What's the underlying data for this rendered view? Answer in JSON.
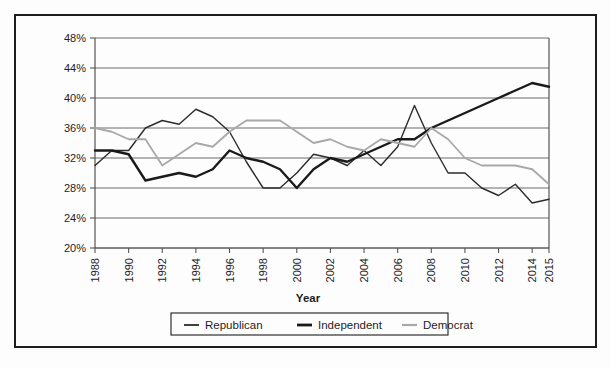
{
  "figure": {
    "top_caption": "",
    "frame_color": "#1d1d1d",
    "background": "#fdfdfd"
  },
  "chart_data": {
    "type": "line",
    "title": "",
    "xlabel": "Year",
    "ylabel": "",
    "grid": true,
    "legend_position": "bottom",
    "xlim": [
      1988,
      2015
    ],
    "ylim": [
      20,
      48
    ],
    "ytick_labels": [
      "20%",
      "24%",
      "28%",
      "32%",
      "36%",
      "40%",
      "44%",
      "48%"
    ],
    "ytick_values": [
      20,
      24,
      28,
      32,
      36,
      40,
      44,
      48
    ],
    "xtick_labels": [
      "1988",
      "1990",
      "1992",
      "1994",
      "1996",
      "1998",
      "2000",
      "2002",
      "2004",
      "2006",
      "2008",
      "2010",
      "2012",
      "2014",
      "2015"
    ],
    "xtick_values": [
      1988,
      1990,
      1992,
      1994,
      1996,
      1998,
      2000,
      2002,
      2004,
      2006,
      2008,
      2010,
      2012,
      2014,
      2015
    ],
    "x": [
      1988,
      1989,
      1990,
      1991,
      1992,
      1993,
      1994,
      1995,
      1996,
      1997,
      1998,
      1999,
      2000,
      2001,
      2002,
      2003,
      2004,
      2005,
      2006,
      2007,
      2008,
      2009,
      2010,
      2011,
      2012,
      2013,
      2014,
      2015
    ],
    "series": [
      {
        "name": "Republican",
        "color": "#2b2b2b",
        "width": 1.4,
        "values": [
          31.0,
          33.0,
          33.0,
          36.0,
          37.0,
          36.5,
          38.5,
          37.5,
          35.5,
          31.5,
          28.0,
          28.0,
          30.0,
          32.5,
          32.0,
          31.0,
          33.0,
          31.0,
          33.5,
          39.0,
          34.0,
          30.0,
          30.0,
          28.0,
          27.0,
          28.5,
          26.0,
          26.5
        ]
      },
      {
        "name": "Independent",
        "color": "#1a1a1a",
        "width": 2.4,
        "values": [
          33.0,
          33.0,
          32.5,
          29.0,
          29.5,
          30.0,
          29.5,
          30.5,
          33.0,
          32.0,
          31.5,
          30.5,
          28.0,
          30.5,
          32.0,
          31.5,
          32.5,
          33.5,
          34.5,
          34.5,
          36.0,
          37.0,
          38.0,
          39.0,
          40.0,
          41.0,
          42.0,
          41.5
        ]
      },
      {
        "name": "Democrat",
        "color": "#a8a8a8",
        "width": 1.8,
        "values": [
          36.0,
          35.5,
          34.5,
          34.5,
          31.0,
          32.5,
          34.0,
          33.5,
          35.5,
          37.0,
          37.0,
          37.0,
          35.5,
          34.0,
          34.5,
          33.5,
          33.0,
          34.5,
          34.0,
          33.5,
          36.0,
          34.5,
          32.0,
          31.0,
          31.0,
          31.0,
          30.5,
          28.5
        ]
      }
    ]
  },
  "legend": {
    "items": [
      {
        "label": "Republican"
      },
      {
        "label": "Independent"
      },
      {
        "label": "Democrat"
      }
    ]
  }
}
